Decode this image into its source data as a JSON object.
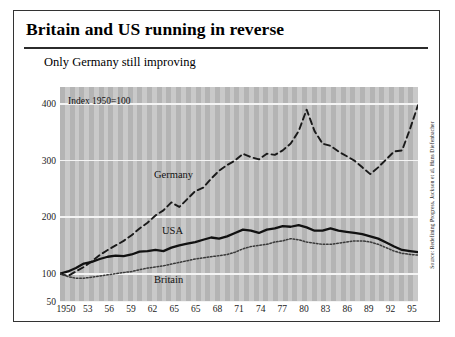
{
  "figure": {
    "title": "Britain and US running in reverse",
    "subtitle": "Only Germany still improving",
    "index_note": "Index 1950=100",
    "source": "Source: Redefining Progress, Jackson et al, Hans Diefenbacher"
  },
  "labels": {
    "germany": "Germany",
    "usa": "USA",
    "britain": "Britain"
  },
  "chart_data": {
    "type": "line",
    "title": "Britain and US running in reverse",
    "subtitle": "Only Germany still improving",
    "xlabel": "",
    "ylabel": "Index 1950=100",
    "xlim": [
      1950,
      1995
    ],
    "ylim": [
      50,
      430
    ],
    "yticks": [
      50,
      100,
      200,
      300,
      400
    ],
    "ytick_labels": [
      "50",
      "100",
      "200",
      "300",
      "400"
    ],
    "xticks": [
      1950,
      1953,
      1956,
      1959,
      1962,
      1965,
      1968,
      1971,
      1974,
      1977,
      1980,
      1983,
      1986,
      1989,
      1992,
      1995
    ],
    "xtick_labels": [
      "1950",
      "53",
      "56",
      "59",
      "62",
      "65",
      "65",
      "68",
      "71",
      "74",
      "77",
      "80",
      "83",
      "86",
      "89",
      "92",
      "95"
    ],
    "xtick_label_note": "Printed axis repeats '65' (original typo); 17 labels span 1950-1995.",
    "grid": "horizontal-white-on-striped-gray",
    "legend": "inline-annotations",
    "x": [
      1950,
      1951,
      1952,
      1953,
      1954,
      1955,
      1956,
      1957,
      1958,
      1959,
      1960,
      1961,
      1962,
      1963,
      1964,
      1965,
      1966,
      1967,
      1968,
      1969,
      1970,
      1971,
      1972,
      1973,
      1974,
      1975,
      1976,
      1977,
      1978,
      1979,
      1980,
      1981,
      1982,
      1983,
      1984,
      1985,
      1986,
      1987,
      1988,
      1989,
      1990,
      1991,
      1992,
      1993,
      1994,
      1995
    ],
    "series": [
      {
        "name": "Germany",
        "style": "dashed",
        "color": "#1a1a1a",
        "values": [
          100,
          96,
          104,
          112,
          122,
          133,
          142,
          150,
          158,
          168,
          180,
          190,
          203,
          212,
          226,
          218,
          232,
          246,
          252,
          268,
          282,
          292,
          300,
          312,
          306,
          302,
          312,
          310,
          318,
          330,
          352,
          390,
          352,
          330,
          326,
          316,
          308,
          300,
          288,
          276,
          288,
          302,
          316,
          318,
          356,
          398
        ]
      },
      {
        "name": "USA",
        "style": "solid",
        "color": "#111111",
        "values": [
          100,
          104,
          110,
          118,
          121,
          126,
          130,
          132,
          131,
          134,
          139,
          140,
          142,
          140,
          146,
          150,
          153,
          156,
          160,
          164,
          162,
          166,
          172,
          178,
          176,
          172,
          178,
          180,
          184,
          183,
          186,
          182,
          176,
          176,
          180,
          176,
          174,
          172,
          170,
          166,
          162,
          155,
          148,
          142,
          140,
          138
        ]
      },
      {
        "name": "Britain",
        "style": "dotted",
        "color": "#3a3a3a",
        "values": [
          100,
          95,
          92,
          92,
          94,
          96,
          98,
          100,
          102,
          104,
          107,
          110,
          112,
          114,
          117,
          120,
          123,
          126,
          128,
          130,
          132,
          134,
          138,
          144,
          148,
          150,
          152,
          156,
          158,
          162,
          160,
          156,
          154,
          152,
          152,
          154,
          156,
          158,
          158,
          156,
          152,
          146,
          140,
          136,
          134,
          133
        ]
      }
    ]
  }
}
